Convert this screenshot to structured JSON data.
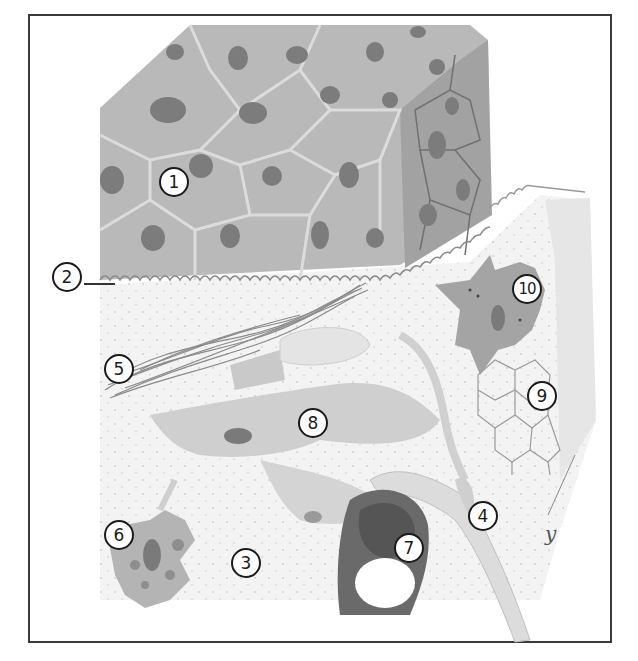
{
  "diagram": {
    "type": "histology-illustration",
    "colors": {
      "frame": "#3a3a3a",
      "epithelium_cell": "#b4b4b4",
      "epithelium_border": "#d8d8d8",
      "nucleus": "#7c7c7c",
      "connective_bg": "#f2f2f2",
      "fibroblast": "#c4c4c4",
      "collagen": "#8a8a8a",
      "vessel_wall": "#6a6a6a",
      "label_border": "#1a1a1a"
    },
    "labels": [
      {
        "id": "1",
        "text": "1",
        "x": 159,
        "y": 167
      },
      {
        "id": "2",
        "text": "2",
        "x": 48,
        "y": 262
      },
      {
        "id": "3",
        "text": "3",
        "x": 231,
        "y": 548
      },
      {
        "id": "4",
        "text": "4",
        "x": 468,
        "y": 501
      },
      {
        "id": "5",
        "text": "5",
        "x": 104,
        "y": 354
      },
      {
        "id": "6",
        "text": "6",
        "x": 104,
        "y": 520
      },
      {
        "id": "7",
        "text": "7",
        "x": 394,
        "y": 533
      },
      {
        "id": "8",
        "text": "8",
        "x": 298,
        "y": 408
      },
      {
        "id": "9",
        "text": "9",
        "x": 527,
        "y": 381
      },
      {
        "id": "10",
        "text": "10",
        "x": 512,
        "y": 274
      }
    ],
    "signature": "y"
  }
}
